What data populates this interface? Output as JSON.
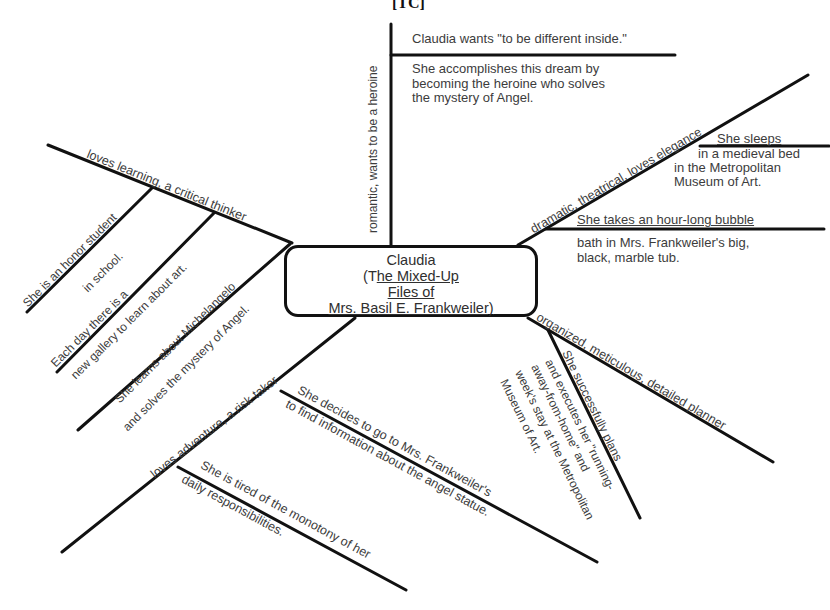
{
  "header": {
    "label": "[TC]"
  },
  "center": {
    "line1": "Claudia",
    "line2_prefix": "(T",
    "line2_underlined": "he Mixed-Up",
    "line3": "Files of",
    "line4": "Mrs. Basil E. Frankweiler)"
  },
  "branches": {
    "top": {
      "trait": "romantic, wants to be a heroine",
      "detail1": "Claudia wants \"to be different inside.\"",
      "detail2_lines": [
        "She accomplishes this dream by",
        "becoming the heroine who solves",
        "the mystery of Angel."
      ]
    },
    "upper_right": {
      "trait": "dramatic, theatrical, loves elegance",
      "detail1_head": "She sleeps",
      "detail1_lines": [
        "in a medieval bed",
        "in the Metropolitan",
        "Museum of Art."
      ],
      "detail2_head": "She takes an hour-long bubble",
      "detail2_lines": [
        "bath in Mrs. Frankweiler's big,",
        "black, marble tub."
      ]
    },
    "upper_left": {
      "trait": "loves learning, a critical thinker",
      "sub1": [
        "She is an honor student",
        "in school."
      ],
      "sub2": [
        "Each day there is a",
        "new gallery to learn about art."
      ],
      "sub3": [
        "She learns about Michelangelo",
        "and solves the mystery of Angel."
      ]
    },
    "lower_left": {
      "trait": "loves adventure, a risk-taker",
      "sub1": [
        "She decides to go to Mrs. Frankweiler's",
        "to find information about the angel statue."
      ],
      "sub2": [
        "She is tired of the monotony of her",
        "daily responsibilities."
      ]
    },
    "lower_right": {
      "trait": "organized, meticulous, detailed planner",
      "sub1": [
        "She successfully plans",
        "and executes her \"running-",
        "away-from-home\" and",
        "week's stay at the Metropolitan",
        "Museum of Art."
      ]
    }
  }
}
